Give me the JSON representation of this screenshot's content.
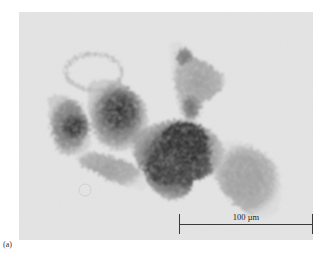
{
  "figure": {
    "panel_label": "(a)",
    "image_description": "Optical micrograph of a dark porous particle aggregate on a light grey background",
    "scale_bar": {
      "label": "100 µm",
      "color": "#3a3a3a"
    },
    "colors": {
      "background": "#e4e4e4",
      "particle_dark": "#2e2e2e",
      "particle_light": "#9a9a9a"
    }
  }
}
